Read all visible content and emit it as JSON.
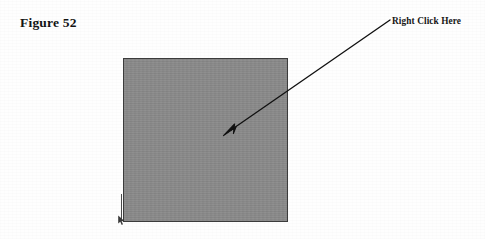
{
  "figure": {
    "caption": "Figure 52",
    "width": 485,
    "height": 239,
    "background_color": "#ffffff"
  },
  "annotation": {
    "label": "Right Click Here",
    "text_color": "#161616",
    "arrow": {
      "color": "#111111",
      "start_x": 392,
      "start_y": 19,
      "end_x": 225,
      "end_y": 134,
      "head": "filled-triangle"
    }
  },
  "panel": {
    "name": "gray-content-area",
    "fill_color": "#8b8b8b",
    "border_color": "#3c3c3c",
    "x": 123,
    "y": 58,
    "width": 165,
    "height": 164
  },
  "corner_marker": {
    "name": "resize-handle-marker",
    "color": "#3a3a3a",
    "x": 122,
    "y": 218
  }
}
